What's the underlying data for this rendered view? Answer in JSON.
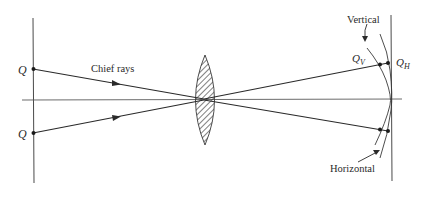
{
  "diagram": {
    "labels": {
      "object_point_top": "Q",
      "object_point_bottom": "Q",
      "chief_rays": "Chief rays",
      "vertical_surface": "Vertical",
      "horizontal_surface": "Horizontal",
      "image_point_vertical": "Q",
      "image_point_vertical_sub": "V",
      "image_point_horizontal": "Q",
      "image_point_horizontal_sub": "H"
    },
    "elements": {
      "object_plane": "vertical line at left",
      "optical_axis": "horizontal line through lens center",
      "lens": "biconvex lens, hatched",
      "image_plane": "vertical line at right (Gaussian image plane)",
      "vertical_focal_surface": "curved surface (inner)",
      "horizontal_focal_surface": "curved surface (outer)"
    },
    "colors": {
      "line": "#3a3a3a",
      "text": "#2a2a2a",
      "background": "#ffffff"
    }
  }
}
